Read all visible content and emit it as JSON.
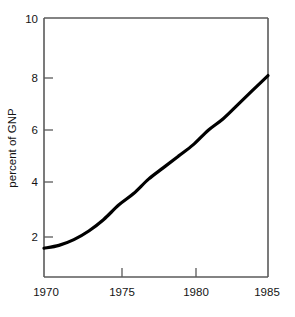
{
  "chart_data": {
    "type": "line",
    "title": "",
    "subtitle": "",
    "xlabel": "",
    "ylabel": "percent of GNP",
    "x": [
      1970,
      1971,
      1972,
      1973,
      1974,
      1975,
      1976,
      1977,
      1978,
      1979,
      1980,
      1981,
      1982,
      1983,
      1984,
      1985
    ],
    "series": [
      {
        "name": "percent of GNP",
        "color": "#000000",
        "values": [
          2.0,
          2.1,
          2.3,
          2.6,
          3.0,
          3.5,
          3.9,
          4.4,
          4.8,
          5.2,
          5.6,
          6.1,
          6.5,
          7.0,
          7.5,
          8.0
        ]
      }
    ],
    "xlim": [
      1970,
      1985
    ],
    "ylim": [
      1,
      10
    ],
    "xticks": [
      1970,
      1975,
      1980,
      1985
    ],
    "xtick_labels": [
      "1970",
      "1975",
      "1980",
      "1985"
    ],
    "yticks": [
      2,
      4,
      6,
      8,
      10
    ],
    "ytick_labels": [
      "2",
      "4",
      "6",
      "8",
      "10"
    ],
    "grid": false,
    "legend": false,
    "legend_position": "none",
    "tick_direction": "in",
    "frame": "left-top-right-bottom",
    "annotations": []
  },
  "axes": {
    "y_axis_title": "percent of GNP",
    "x_axis_title": ""
  },
  "colors": {
    "curve": "#000000",
    "frame": "#5a5a5a",
    "text": "#141414",
    "background": "#ffffff"
  }
}
